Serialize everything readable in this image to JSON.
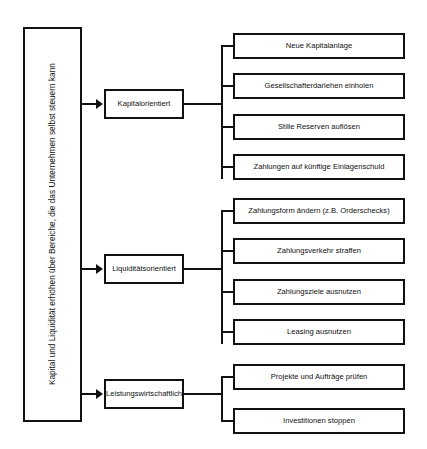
{
  "diagram": {
    "root": {
      "label": "Kapital und Liquidität erhöhen über Bereiche, die das Unternehmen selbst steuern kann"
    },
    "categories": [
      {
        "label": "Kapitalorientiert"
      },
      {
        "label": "Liquiditätsorientiert"
      },
      {
        "label": "Leistungswirtschaftlich"
      }
    ],
    "groups": [
      {
        "category": "Kapitalorientiert",
        "measures": [
          {
            "label": "Neue Kapitalanlage"
          },
          {
            "label": "Gesellschafterdarlehen einholen"
          },
          {
            "label": "Stille Reserven auflösen"
          },
          {
            "label": "Zahlungen auf künftige Einlagenschuld"
          }
        ]
      },
      {
        "category": "Liquiditätsorientiert",
        "measures": [
          {
            "label": "Zahlungsform ändern (z.B. Orderschecks)"
          },
          {
            "label": "Zahlungsverkehr straffen"
          },
          {
            "label": "Zahlungsziele ausnutzen"
          },
          {
            "label": "Leasing ausnutzen"
          }
        ]
      },
      {
        "category": "Leistungswirtschaftlich",
        "measures": [
          {
            "label": "Projekte und Aufträge prüfen"
          },
          {
            "label": "Investitionen stoppen"
          }
        ]
      }
    ],
    "colors": {
      "line": "#111111",
      "box_fill": "#ffffff",
      "text": "#111111"
    }
  }
}
